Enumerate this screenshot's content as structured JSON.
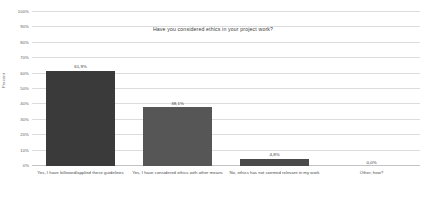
{
  "chart_data": {
    "type": "bar",
    "title": "Have you considered ethics in your project work?",
    "xlabel": "",
    "ylabel": "Percent",
    "ylim": [
      0,
      100
    ],
    "grid": true,
    "legend": "none",
    "categories": [
      "Yes, I have followed/applied these guidelines",
      "Yes, I have considered ethics with other means",
      "No, ethics has not seemed relevant in my work",
      "Other, how?"
    ],
    "values": [
      61.9,
      38.1,
      4.8,
      0.0
    ],
    "value_labels": [
      "61,9%",
      "38,1%",
      "4,8%",
      "0,0%"
    ],
    "yticks": [
      0,
      10,
      20,
      30,
      40,
      50,
      60,
      70,
      80,
      90,
      100
    ],
    "ytick_labels": [
      "0%",
      "10%",
      "20%",
      "30%",
      "40%",
      "50%",
      "60%",
      "70%",
      "80%",
      "90%",
      "100%"
    ],
    "bar_colors": [
      "#3a3a3a",
      "#565656",
      "#4a4a4a",
      "#4a4a4a"
    ]
  },
  "colors": {
    "gridline": "#dcdcdc",
    "baseline": "#c3c3c3",
    "text": "#3c3c3c",
    "background": "#ffffff"
  }
}
